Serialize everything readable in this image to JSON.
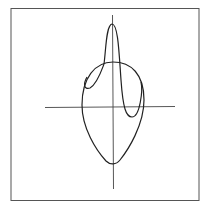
{
  "figure": {
    "colors": {
      "background": "#ffffff",
      "frame": "#555555",
      "axes": "#444444",
      "curve": "#222222"
    },
    "axes": {
      "horizontal": true,
      "vertical": true
    },
    "curves": [
      {
        "name": "egg-curve",
        "shape": "closed oval, wider at top"
      },
      {
        "name": "loop-curve",
        "shape": "tall narrow petal above origin with side lobes"
      }
    ]
  }
}
